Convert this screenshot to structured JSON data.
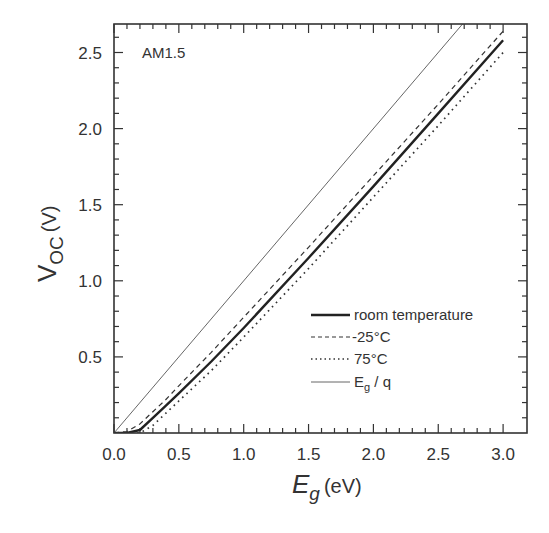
{
  "chart_data": {
    "type": "line",
    "title": "",
    "annotation": "AM1.5",
    "xlabel": "E_g (eV)",
    "xlabel_main": "E",
    "xlabel_sub": "g",
    "xlabel_unit": "(eV)",
    "ylabel": "V_OC (V)",
    "ylabel_main": "V",
    "ylabel_sub": "OC",
    "ylabel_unit": "(V)",
    "xlim": [
      0,
      3.08
    ],
    "ylim": [
      0,
      2.69
    ],
    "xticks": [
      "0.0",
      "0.5",
      "1.0",
      "1.5",
      "2.0",
      "2.5",
      "3.0"
    ],
    "yticks": [
      "0.5",
      "1.0",
      "1.5",
      "2.0",
      "2.5"
    ],
    "legend_position": "lower right",
    "series": [
      {
        "name": "room temperature",
        "style": "solid-thick",
        "x": [
          0.0,
          0.1,
          0.2,
          0.3,
          0.4,
          0.5,
          0.75,
          1.0,
          1.5,
          2.0,
          2.5,
          3.0
        ],
        "y": [
          0.0,
          0.0,
          0.02,
          0.1,
          0.18,
          0.26,
          0.47,
          0.69,
          1.15,
          1.62,
          2.1,
          2.58
        ]
      },
      {
        "name": "-25°C",
        "style": "dashed",
        "x": [
          0.0,
          0.1,
          0.2,
          0.3,
          0.4,
          0.5,
          0.75,
          1.0,
          1.5,
          2.0,
          2.5,
          3.0
        ],
        "y": [
          0.0,
          0.01,
          0.06,
          0.14,
          0.22,
          0.31,
          0.53,
          0.76,
          1.22,
          1.69,
          2.16,
          2.64
        ]
      },
      {
        "name": "75°C",
        "style": "dotted",
        "x": [
          0.0,
          0.1,
          0.2,
          0.3,
          0.4,
          0.5,
          0.75,
          1.0,
          1.5,
          2.0,
          2.5,
          3.0
        ],
        "y": [
          0.0,
          0.0,
          0.0,
          0.05,
          0.13,
          0.21,
          0.41,
          0.63,
          1.08,
          1.55,
          2.02,
          2.5
        ]
      },
      {
        "name": "E_g / q",
        "legend_main": "E",
        "legend_sub": "g",
        "legend_rest": " / q",
        "style": "solid-thin",
        "x": [
          0.0,
          2.69
        ],
        "y": [
          0.0,
          2.69
        ]
      }
    ]
  }
}
